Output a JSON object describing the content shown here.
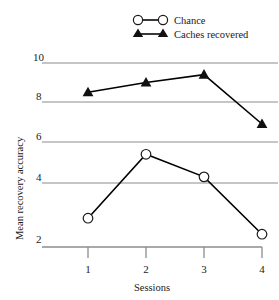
{
  "chart_data": {
    "type": "line",
    "title": "",
    "xlabel": "Sessions",
    "ylabel": "Mean recovery accuracy",
    "categories": [
      "1",
      "2",
      "3",
      "4"
    ],
    "x": [
      1,
      2,
      3,
      4
    ],
    "xlim": [
      0.55,
      4.1
    ],
    "ylim": [
      2,
      10
    ],
    "yticks": [
      2,
      4,
      6,
      8,
      10
    ],
    "ytick_labels": [
      "2",
      "4",
      "6",
      "8",
      "10"
    ],
    "xtick_labels": [
      "1",
      "2",
      "3",
      "4"
    ],
    "grid": "horizontal",
    "legend_position": "top-right",
    "series": [
      {
        "name": "Chance",
        "marker": "open-circle",
        "color": "#000000",
        "values": [
          2.9,
          5.4,
          4.3,
          2.4
        ]
      },
      {
        "name": "Caches recovered",
        "marker": "filled-triangle",
        "color": "#000000",
        "values": [
          8.5,
          9.0,
          9.4,
          6.9
        ]
      }
    ]
  },
  "legend": {
    "items": [
      {
        "label": "Chance",
        "marker": "open-circle"
      },
      {
        "label": "Caches recovered",
        "marker": "filled-triangle"
      }
    ]
  },
  "axes": {
    "y_title": "Mean recovery accuracy",
    "x_title": "Sessions",
    "y_tick_10": "10",
    "y_tick_8": "8",
    "y_tick_6": "6",
    "y_tick_4": "4",
    "y_tick_2": "2",
    "x_tick_1": "1",
    "x_tick_2": "2",
    "x_tick_3": "3",
    "x_tick_4": "4"
  },
  "colors": {
    "line": "#1a1a1a",
    "grid": "#8c8c8c",
    "axis": "#8c8c8c",
    "marker_fill_open": "#ffffff",
    "marker_fill_solid": "#111111"
  }
}
